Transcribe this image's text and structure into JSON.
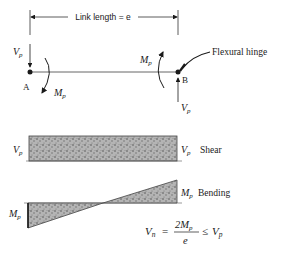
{
  "diagram": {
    "dimension": {
      "label": "Link length = e"
    },
    "nodes": {
      "a": {
        "label": "A",
        "shear_label": "V",
        "shear_sub": "p",
        "moment_label": "M",
        "moment_sub": "p"
      },
      "b": {
        "label": "B",
        "shear_label": "V",
        "shear_sub": "p",
        "moment_label": "M",
        "moment_sub": "p"
      }
    },
    "hinge": {
      "label": "Flexural hinge"
    },
    "shear": {
      "title": "Shear",
      "left_label": "V",
      "left_sub": "p",
      "right_label": "V",
      "right_sub": "p"
    },
    "bending": {
      "title": "Bending",
      "left_label": "M",
      "left_sub": "p",
      "right_label": "M",
      "right_sub": "p"
    },
    "equation": {
      "lhs": "V",
      "lhs_sub": "n",
      "eq": "=",
      "numerator": "2M",
      "numerator_sub": "p",
      "denominator": "e",
      "rel": "≤",
      "rhs": "V",
      "rhs_sub": "p"
    }
  },
  "colors": {
    "ink": "#1a1a1a",
    "fill": "#9a9a9a",
    "line": "#555555"
  }
}
